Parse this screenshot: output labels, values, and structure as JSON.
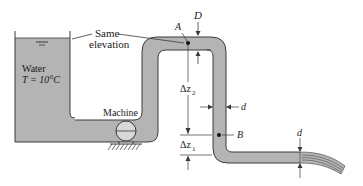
{
  "diagram": {
    "type": "fluid-system",
    "labels": {
      "same_elevation_line1": "Same",
      "same_elevation_line2": "elevation",
      "water": "Water",
      "temperature": "T = 10°C",
      "machine": "Machine",
      "point_a": "A",
      "point_b": "B",
      "diameter_large": "D",
      "diameter_small_vertical": "d",
      "diameter_small_outlet": "d",
      "delta_z2": "Δz",
      "delta_z2_sub": "2",
      "delta_z1": "Δz",
      "delta_z1_sub": "1"
    },
    "colors": {
      "fluid": "#b4b4b4",
      "outline": "#3a3a3a",
      "background": "#ffffff"
    }
  }
}
